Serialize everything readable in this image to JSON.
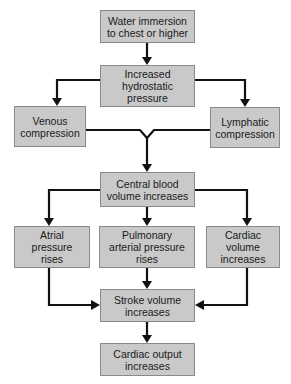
{
  "diagram": {
    "type": "flowchart",
    "colors": {
      "box_fill": "#c9c9c9",
      "box_border": "#8a8a8a",
      "connector": "#111111",
      "background": "#ffffff"
    },
    "nodes": [
      {
        "id": "water_immersion",
        "label": "Water immersion\nto chest or higher"
      },
      {
        "id": "hydrostatic",
        "label": "Increased\nhydrostatic\npressure"
      },
      {
        "id": "venous",
        "label": "Venous\ncompression"
      },
      {
        "id": "lymphatic",
        "label": "Lymphatic\ncompression"
      },
      {
        "id": "central_blood",
        "label": "Central blood\nvolume increases"
      },
      {
        "id": "atrial",
        "label": "Atrial\npressure\nrises"
      },
      {
        "id": "pulmonary",
        "label": "Pulmonary\narterial pressure\nrises"
      },
      {
        "id": "cardiac_volume",
        "label": "Cardiac\nvolume\nincreases"
      },
      {
        "id": "stroke_volume",
        "label": "Stroke volume\nincreases"
      },
      {
        "id": "cardiac_output",
        "label": "Cardiac output\nincreases"
      }
    ],
    "edges": [
      {
        "from": "water_immersion",
        "to": "hydrostatic"
      },
      {
        "from": "hydrostatic",
        "to": "venous"
      },
      {
        "from": "hydrostatic",
        "to": "lymphatic"
      },
      {
        "from": "venous",
        "to": "central_blood"
      },
      {
        "from": "lymphatic",
        "to": "central_blood"
      },
      {
        "from": "central_blood",
        "to": "atrial"
      },
      {
        "from": "central_blood",
        "to": "pulmonary"
      },
      {
        "from": "central_blood",
        "to": "cardiac_volume"
      },
      {
        "from": "atrial",
        "to": "stroke_volume"
      },
      {
        "from": "pulmonary",
        "to": "stroke_volume"
      },
      {
        "from": "cardiac_volume",
        "to": "stroke_volume"
      },
      {
        "from": "stroke_volume",
        "to": "cardiac_output"
      }
    ]
  }
}
